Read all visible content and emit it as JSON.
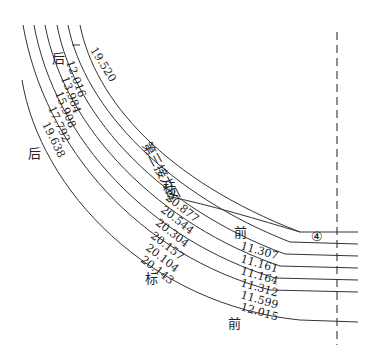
{
  "diagram": {
    "title": "第三接力区",
    "marker_number": "④",
    "labels": {
      "back_top": "后",
      "back_left": "后",
      "mark_top": "标",
      "mark_bottom": "标",
      "front_top": "前",
      "front_bottom": "前"
    },
    "top_value": "19.520",
    "back_values": [
      "12.016",
      "13.984",
      "15.908",
      "17.792",
      "19.638"
    ],
    "mark_values": [
      "20.877",
      "20.544",
      "20.304",
      "20.157",
      "20.104",
      "20.143"
    ],
    "front_values": [
      "11.307",
      "11.161",
      "11.164",
      "11.312",
      "11.599",
      "12.015"
    ]
  }
}
